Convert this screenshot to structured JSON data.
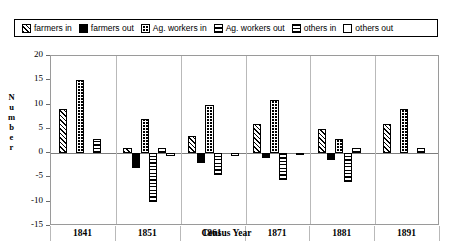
{
  "legend": {
    "items": [
      {
        "label": "farmers in",
        "pattern": "diagonal-hatch",
        "key": "farmers_in"
      },
      {
        "label": "farmers out",
        "pattern": "solid-black",
        "key": "farmers_out"
      },
      {
        "label": "Ag. workers in",
        "pattern": "dense-dots",
        "key": "ag_workers_in"
      },
      {
        "label": "Ag. workers out",
        "pattern": "crosshatch-grid",
        "key": "ag_workers_out"
      },
      {
        "label": "others in",
        "pattern": "horizontal-lines",
        "key": "others_in"
      },
      {
        "label": "others out",
        "pattern": "empty-white",
        "key": "others_out"
      }
    ]
  },
  "chart_data": {
    "type": "bar",
    "title": "",
    "xlabel": "Census Year",
    "ylabel": "Number",
    "categories": [
      "1841",
      "1851",
      "1861",
      "1871",
      "1881",
      "1891"
    ],
    "ylim": [
      -15,
      20
    ],
    "yticks": [
      20,
      15,
      10,
      5,
      0,
      -5,
      -10,
      -15
    ],
    "ytick_labels": [
      "20",
      "15",
      "10",
      "5",
      "0",
      "-5",
      "-10",
      "-15"
    ],
    "grid": false,
    "legend_position": "top",
    "series": [
      {
        "name": "farmers in",
        "values": [
          9,
          1,
          3.5,
          6,
          5,
          6
        ]
      },
      {
        "name": "farmers out",
        "values": [
          0,
          -3,
          -2,
          -1,
          -1.5,
          0
        ]
      },
      {
        "name": "Ag. workers in",
        "values": [
          15,
          7,
          10,
          11,
          3,
          9
        ]
      },
      {
        "name": "Ag. workers out",
        "values": [
          0,
          -10,
          -4.5,
          -5.5,
          -6,
          0
        ]
      },
      {
        "name": "others in",
        "values": [
          3,
          1,
          0,
          0,
          1,
          1
        ]
      },
      {
        "name": "others out",
        "values": [
          0,
          -0.6,
          -0.6,
          -0.4,
          0,
          0
        ]
      }
    ]
  }
}
